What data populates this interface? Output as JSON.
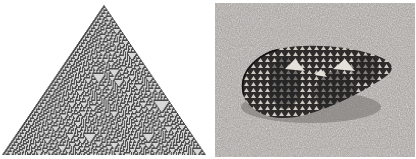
{
  "figure": {
    "panels": [
      {
        "id": "cellular-automaton",
        "description": "Triangular cellular automaton pattern (Rule 30 style) of dark gray cells with scattered small white triangles",
        "colors": {
          "cell_on": "#4a4a4a",
          "cell_off": "#d8d8d8",
          "background": "#ffffff"
        }
      },
      {
        "id": "cone-shell-photo",
        "description": "Grayscale photograph of a textile cone shell resting on sand, with a net-like pattern of dark reticulation and pale tent-shaped spots",
        "colors": {
          "sand": "#a8a4a0",
          "shell_dark": "#2e2c2b",
          "shell_light": "#d6d2cc"
        }
      }
    ]
  }
}
